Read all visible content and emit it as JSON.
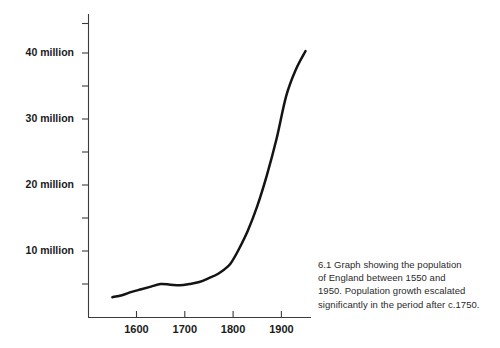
{
  "figure": {
    "caption_lines": [
      "6.1 Graph showing the population",
      "of England between 1550 and",
      "1950. Population growth escalated",
      "significantly in the period after c.1750."
    ]
  },
  "chart_data": {
    "type": "line",
    "title": "",
    "xlabel": "",
    "ylabel": "",
    "xlim": [
      1540,
      1960
    ],
    "ylim": [
      0,
      45
    ],
    "grid": false,
    "legend": null,
    "y_unit": "million",
    "x_tick_labels": [
      "1600",
      "1700",
      "1800",
      "1900"
    ],
    "x_ticks": [
      1600,
      1700,
      1800,
      1900
    ],
    "y_tick_labels": [
      "10 million",
      "20 million",
      "30 million",
      "40 million"
    ],
    "y_ticks": [
      10,
      20,
      30,
      40
    ],
    "y_minor_ticks": [
      5,
      15,
      25,
      35,
      45
    ],
    "series": [
      {
        "name": "Population of England",
        "x": [
          1550,
          1570,
          1590,
          1610,
          1630,
          1650,
          1670,
          1690,
          1710,
          1730,
          1750,
          1770,
          1790,
          1800,
          1810,
          1830,
          1850,
          1870,
          1890,
          1910,
          1930,
          1950
        ],
        "values": [
          3.0,
          3.3,
          3.8,
          4.2,
          4.6,
          5.0,
          4.9,
          4.8,
          5.0,
          5.3,
          5.9,
          6.6,
          7.7,
          8.7,
          10.0,
          13.0,
          16.8,
          21.5,
          27.0,
          33.5,
          37.5,
          40.3
        ]
      }
    ]
  }
}
